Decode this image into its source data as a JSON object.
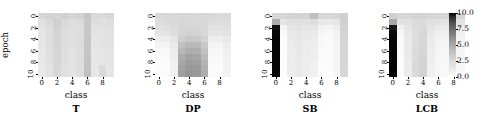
{
  "figure": {
    "axis_labels": {
      "x": "class",
      "y": "epoch"
    },
    "xticks": [
      0,
      2,
      4,
      6,
      8
    ],
    "yticks": [
      0,
      2,
      4,
      6,
      8,
      10
    ]
  },
  "colorbar": {
    "name": "colorbar",
    "ticks": [
      "10.0",
      "7.5",
      "5.0",
      "2.5",
      "0.0"
    ],
    "vmin": 0.0,
    "vmax": 10.0,
    "cmap": "Greys",
    "position": "right"
  },
  "chart_data": [
    {
      "type": "heatmap",
      "title": "T",
      "xlabel": "class",
      "ylabel": "epoch",
      "x": [
        0,
        1,
        2,
        3,
        4,
        5,
        6,
        7,
        8,
        9
      ],
      "y": [
        0,
        1,
        2,
        3,
        4,
        5,
        6,
        7,
        8,
        9,
        10
      ],
      "zlim": [
        0.0,
        10.0
      ],
      "values": [
        [
          3.1,
          3.4,
          3.3,
          3.5,
          3.2,
          3.4,
          4.0,
          3.0,
          2.9,
          3.1
        ],
        [
          2.6,
          3.0,
          3.5,
          3.0,
          2.8,
          2.9,
          3.9,
          2.7,
          2.6,
          2.8
        ],
        [
          2.4,
          2.8,
          3.4,
          2.9,
          2.7,
          2.8,
          3.9,
          2.5,
          2.5,
          2.6
        ],
        [
          2.3,
          2.7,
          3.3,
          2.8,
          2.6,
          2.8,
          3.9,
          2.4,
          2.4,
          2.5
        ],
        [
          2.2,
          2.7,
          3.3,
          2.8,
          2.6,
          2.8,
          4.0,
          2.3,
          2.4,
          2.5
        ],
        [
          2.2,
          2.7,
          3.3,
          2.8,
          2.6,
          2.8,
          4.0,
          2.3,
          2.4,
          2.5
        ],
        [
          2.2,
          2.6,
          3.2,
          2.7,
          2.5,
          2.8,
          4.0,
          2.2,
          2.3,
          2.4
        ],
        [
          2.1,
          2.6,
          3.2,
          2.7,
          2.5,
          2.8,
          4.1,
          2.2,
          2.3,
          2.4
        ],
        [
          2.1,
          2.6,
          3.2,
          2.7,
          2.5,
          2.8,
          4.1,
          2.2,
          2.3,
          2.4
        ],
        [
          2.0,
          2.5,
          3.1,
          2.6,
          2.4,
          2.7,
          4.1,
          2.1,
          2.9,
          2.3
        ],
        [
          2.0,
          2.5,
          3.1,
          2.6,
          2.4,
          2.7,
          4.2,
          2.1,
          3.0,
          2.3
        ]
      ]
    },
    {
      "type": "heatmap",
      "title": "DP",
      "xlabel": "class",
      "ylabel": "epoch",
      "x": [
        0,
        1,
        2,
        3,
        4,
        5,
        6,
        7,
        8,
        9
      ],
      "y": [
        0,
        1,
        2,
        3,
        4,
        5,
        6,
        7,
        8,
        9,
        10
      ],
      "zlim": [
        0.0,
        10.0
      ],
      "values": [
        [
          3.0,
          3.1,
          3.0,
          3.2,
          3.1,
          3.0,
          3.1,
          3.0,
          2.9,
          3.0
        ],
        [
          2.8,
          2.9,
          3.0,
          3.1,
          3.1,
          3.0,
          3.0,
          2.8,
          2.7,
          2.8
        ],
        [
          2.6,
          2.7,
          2.9,
          3.2,
          3.2,
          3.1,
          3.0,
          2.6,
          2.5,
          2.6
        ],
        [
          2.3,
          2.4,
          2.7,
          3.3,
          3.4,
          3.3,
          3.1,
          2.3,
          2.2,
          2.4
        ],
        [
          1.6,
          1.7,
          2.3,
          3.6,
          3.9,
          3.8,
          3.4,
          1.7,
          1.6,
          2.0
        ],
        [
          1.0,
          1.1,
          1.9,
          4.2,
          4.6,
          4.5,
          3.9,
          1.2,
          1.1,
          1.7
        ],
        [
          0.7,
          0.8,
          1.7,
          4.6,
          5.0,
          4.9,
          4.2,
          0.9,
          0.8,
          1.5
        ],
        [
          0.5,
          0.6,
          1.6,
          5.0,
          5.4,
          5.3,
          4.5,
          0.7,
          0.6,
          1.4
        ],
        [
          0.4,
          0.5,
          1.5,
          5.2,
          5.6,
          5.5,
          4.7,
          0.6,
          0.5,
          1.3
        ],
        [
          0.3,
          0.4,
          1.5,
          5.4,
          5.8,
          5.7,
          4.9,
          0.5,
          0.4,
          1.3
        ],
        [
          0.3,
          0.4,
          1.4,
          5.5,
          5.9,
          5.8,
          5.0,
          0.5,
          0.4,
          1.2
        ]
      ]
    },
    {
      "type": "heatmap",
      "title": "SB",
      "xlabel": "class",
      "ylabel": "epoch",
      "x": [
        0,
        1,
        2,
        3,
        4,
        5,
        6,
        7,
        8,
        9
      ],
      "y": [
        0,
        1,
        2,
        3,
        4,
        5,
        6,
        7,
        8,
        9,
        10
      ],
      "zlim": [
        0.0,
        10.0
      ],
      "values": [
        [
          3.2,
          3.1,
          3.3,
          3.4,
          3.3,
          4.3,
          3.2,
          3.1,
          3.2,
          3.6
        ],
        [
          5.0,
          2.3,
          2.6,
          2.7,
          2.6,
          2.8,
          2.1,
          2.0,
          2.2,
          3.5
        ],
        [
          9.6,
          1.2,
          2.2,
          2.4,
          2.2,
          2.3,
          1.3,
          1.1,
          1.6,
          3.4
        ],
        [
          9.8,
          0.6,
          2.0,
          2.2,
          2.0,
          2.0,
          0.9,
          0.7,
          1.3,
          3.3
        ],
        [
          9.9,
          0.4,
          1.9,
          2.1,
          1.9,
          1.8,
          0.7,
          0.5,
          1.2,
          3.3
        ],
        [
          9.9,
          0.3,
          1.8,
          2.1,
          1.8,
          1.7,
          0.6,
          0.4,
          1.1,
          3.2
        ],
        [
          9.9,
          0.3,
          1.8,
          2.0,
          1.8,
          1.6,
          0.5,
          0.4,
          1.1,
          3.2
        ],
        [
          9.9,
          0.2,
          1.7,
          2.0,
          1.7,
          1.6,
          0.5,
          0.3,
          1.0,
          3.2
        ],
        [
          9.9,
          0.2,
          1.7,
          2.0,
          1.7,
          1.5,
          0.4,
          0.3,
          1.0,
          3.1
        ],
        [
          9.9,
          0.2,
          1.7,
          1.9,
          1.7,
          1.5,
          0.4,
          0.3,
          1.0,
          3.1
        ],
        [
          9.9,
          0.2,
          1.6,
          1.9,
          1.6,
          1.4,
          0.4,
          0.3,
          0.9,
          3.1
        ]
      ]
    },
    {
      "type": "heatmap",
      "title": "LCB",
      "xlabel": "class",
      "ylabel": "epoch",
      "x": [
        0,
        1,
        2,
        3,
        4,
        5,
        6,
        7,
        8,
        9
      ],
      "y": [
        0,
        1,
        2,
        3,
        4,
        5,
        6,
        7,
        8,
        9,
        10
      ],
      "zlim": [
        0.0,
        10.0
      ],
      "values": [
        [
          3.5,
          3.2,
          3.2,
          3.3,
          3.3,
          3.2,
          3.1,
          3.2,
          3.1,
          3.2
        ],
        [
          5.2,
          2.5,
          2.6,
          2.9,
          2.9,
          2.6,
          2.5,
          2.5,
          2.4,
          2.5
        ],
        [
          9.5,
          1.5,
          2.3,
          2.8,
          2.9,
          2.3,
          2.0,
          1.9,
          1.8,
          1.9
        ],
        [
          9.8,
          0.9,
          2.1,
          2.8,
          3.1,
          2.1,
          1.6,
          1.5,
          1.4,
          1.5
        ],
        [
          9.9,
          0.6,
          2.0,
          2.8,
          3.1,
          1.9,
          1.3,
          1.2,
          1.2,
          1.2
        ],
        [
          9.9,
          0.5,
          1.9,
          2.8,
          3.2,
          1.8,
          1.1,
          1.0,
          1.0,
          1.1
        ],
        [
          9.9,
          0.4,
          1.9,
          2.9,
          3.2,
          1.7,
          1.0,
          0.9,
          0.9,
          1.0
        ],
        [
          9.9,
          0.4,
          1.9,
          2.9,
          3.3,
          1.6,
          0.9,
          0.8,
          0.8,
          0.9
        ],
        [
          9.9,
          0.3,
          1.8,
          3.0,
          3.3,
          1.6,
          0.8,
          0.7,
          0.8,
          0.9
        ],
        [
          9.9,
          0.3,
          1.8,
          3.0,
          3.4,
          1.5,
          0.8,
          0.7,
          0.7,
          0.8
        ],
        [
          9.9,
          0.3,
          1.8,
          3.0,
          3.4,
          1.5,
          0.7,
          0.6,
          0.7,
          0.8
        ]
      ]
    }
  ]
}
